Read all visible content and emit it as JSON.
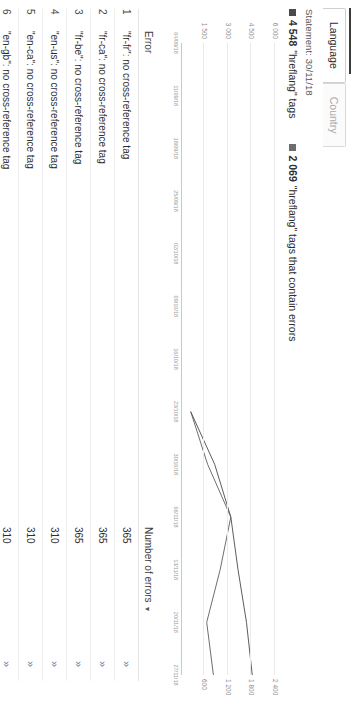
{
  "tabs": [
    {
      "label": "Language",
      "active": true
    },
    {
      "label": "Country",
      "active": false
    }
  ],
  "statement": "Statement: 30/11/18",
  "legend": [
    {
      "color": "#4a4a4a",
      "value": "4 548",
      "text": "\"hreflang\" tags"
    },
    {
      "color": "#6d6d6d",
      "value": "2 069",
      "text": "\"hreflang\" tags that contain errors"
    }
  ],
  "chart_data": {
    "type": "line",
    "title": "",
    "xlabel": "",
    "ylabel": "",
    "ylim": [
      0,
      6000
    ],
    "yticks": [
      "1 500",
      "3 000",
      "4 500",
      "6 000"
    ],
    "ytick_values": [
      1500,
      3000,
      4500,
      6000
    ],
    "extra_yticks": [
      "600",
      "1 200",
      "1 800",
      "2 400"
    ],
    "grid": true,
    "legend_position": "top-left",
    "x": [
      "04/09/18",
      "11/09/18",
      "18/09/18",
      "25/09/18",
      "02/10/18",
      "09/10/18",
      "16/10/18",
      "23/10/18",
      "30/10/18",
      "06/11/18",
      "13/11/18",
      "20/11/18",
      "27/11/18"
    ],
    "series": [
      {
        "name": "\"hreflang\" tags",
        "color": "#4a4a4a",
        "values": [
          null,
          null,
          null,
          null,
          null,
          null,
          null,
          620,
          2150,
          3180,
          3640,
          4180,
          4548
        ]
      },
      {
        "name": "\"hreflang\" tags that contain errors",
        "color": "#5e5e5e",
        "values": [
          null,
          null,
          null,
          null,
          null,
          null,
          null,
          620,
          1700,
          3180,
          2500,
          1640,
          2069
        ]
      }
    ]
  },
  "table": {
    "columns": [
      "",
      "Error",
      "Number of errors",
      ""
    ],
    "sort_column": "Number of errors",
    "sort_direction": "desc",
    "sort_caret": "▼",
    "action_icon": "»",
    "rows": [
      {
        "index": "1",
        "error": "\"fr-fr\": no cross-reference tag",
        "errors": "365"
      },
      {
        "index": "2",
        "error": "\"fr-ca\": no cross-reference tag",
        "errors": "365"
      },
      {
        "index": "3",
        "error": "\"fr-be\": no cross-reference tag",
        "errors": "365"
      },
      {
        "index": "4",
        "error": "\"en-us\": no cross-reference tag",
        "errors": "310"
      },
      {
        "index": "5",
        "error": "\"en-ca\": no cross-reference tag",
        "errors": "310"
      },
      {
        "index": "6",
        "error": "\"en-gb\": no cross-reference tag",
        "errors": "310"
      }
    ]
  }
}
